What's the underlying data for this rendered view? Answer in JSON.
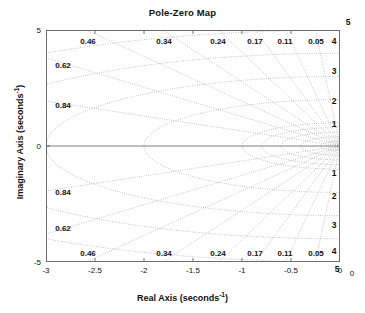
{
  "chart_data": {
    "type": "line",
    "title": "Pole-Zero Map",
    "xlabel_text": "Real Axis (seconds",
    "xlabel_sup": "-1",
    "xlabel_tail": ")",
    "ylabel_text": "Imaginary Axis (seconds",
    "ylabel_sup": "-1",
    "ylabel_tail": ")",
    "xlim": [
      -3,
      0
    ],
    "ylim": [
      -5,
      5
    ],
    "grid": true,
    "legend": "none",
    "xticks": [
      {
        "value": -3,
        "label": "-3"
      },
      {
        "value": -2.5,
        "label": "-2.5"
      },
      {
        "value": -2,
        "label": "-2"
      },
      {
        "value": -1.5,
        "label": "-1.5"
      },
      {
        "value": -1,
        "label": "-1"
      },
      {
        "value": -0.5,
        "label": "-0.5"
      },
      {
        "value": 0,
        "label": "0"
      }
    ],
    "yticks": [
      {
        "value": 5,
        "label": "5"
      },
      {
        "value": 0,
        "label": "0"
      },
      {
        "value": -5,
        "label": "-5"
      }
    ],
    "damping_ratios": [
      0.05,
      0.11,
      0.17,
      0.24,
      0.34,
      0.46,
      0.62,
      0.84
    ],
    "damping_labels_top": [
      {
        "zeta": 0.46,
        "label": "0.46",
        "x_px": 88,
        "y_px": 41
      },
      {
        "zeta": 0.34,
        "label": "0.34",
        "x_px": 164,
        "y_px": 41
      },
      {
        "zeta": 0.24,
        "label": "0.24",
        "x_px": 218,
        "y_px": 41
      },
      {
        "zeta": 0.17,
        "label": "0.17",
        "x_px": 255,
        "y_px": 41
      },
      {
        "zeta": 0.11,
        "label": "0.11",
        "x_px": 285,
        "y_px": 41
      },
      {
        "zeta": 0.05,
        "label": "0.05",
        "x_px": 316,
        "y_px": 41
      }
    ],
    "damping_labels_left_top": [
      {
        "zeta": 0.62,
        "label": "0.62",
        "x_px": 63,
        "y_px": 65
      },
      {
        "zeta": 0.84,
        "label": "0.84",
        "x_px": 63,
        "y_px": 105
      }
    ],
    "damping_labels_left_bottom": [
      {
        "zeta": 0.84,
        "label": "0.84",
        "x_px": 63,
        "y_px": 192
      },
      {
        "zeta": 0.62,
        "label": "0.62",
        "x_px": 63,
        "y_px": 228
      }
    ],
    "damping_labels_bottom": [
      {
        "zeta": 0.46,
        "label": "0.46",
        "x_px": 88,
        "y_px": 253
      },
      {
        "zeta": 0.34,
        "label": "0.34",
        "x_px": 164,
        "y_px": 253
      },
      {
        "zeta": 0.24,
        "label": "0.24",
        "x_px": 218,
        "y_px": 253
      },
      {
        "zeta": 0.17,
        "label": "0.17",
        "x_px": 255,
        "y_px": 253
      },
      {
        "zeta": 0.11,
        "label": "0.11",
        "x_px": 285,
        "y_px": 253
      },
      {
        "zeta": 0.05,
        "label": "0.05",
        "x_px": 316,
        "y_px": 253
      }
    ],
    "natural_frequencies": [
      1,
      2,
      3,
      4,
      5
    ],
    "frequency_labels_right": [
      {
        "wn": 5,
        "label": "5",
        "x_px": 348,
        "y_px": 22
      },
      {
        "wn": 4,
        "label": "4",
        "x_px": 334,
        "y_px": 41
      },
      {
        "wn": 3,
        "label": "3",
        "x_px": 334,
        "y_px": 71
      },
      {
        "wn": 2,
        "label": "2",
        "x_px": 334,
        "y_px": 101
      },
      {
        "wn": 1,
        "label": "1",
        "x_px": 334,
        "y_px": 124
      },
      {
        "wn": 1,
        "label": "1",
        "x_px": 334,
        "y_px": 173
      },
      {
        "wn": 2,
        "label": "2",
        "x_px": 334,
        "y_px": 196
      },
      {
        "wn": 3,
        "label": "3",
        "x_px": 334,
        "y_px": 225
      },
      {
        "wn": 4,
        "label": "4",
        "x_px": 334,
        "y_px": 251
      },
      {
        "wn": 5,
        "label": "5",
        "x_px": 337,
        "y_px": 269
      }
    ],
    "corner_label_bottom_right": "0",
    "poles": [],
    "zeros": []
  }
}
